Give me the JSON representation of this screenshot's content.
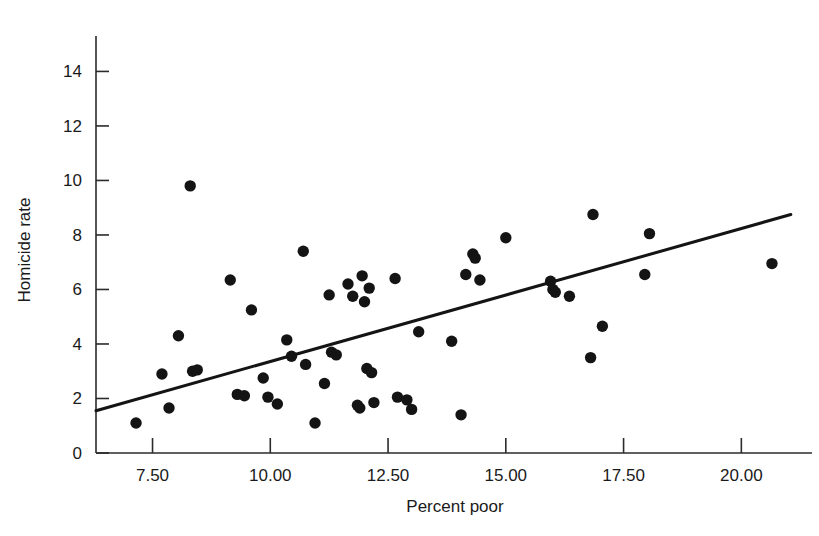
{
  "chart_data": {
    "type": "scatter",
    "title": "",
    "xlabel": "Percent poor",
    "ylabel": "Homicide rate",
    "xlim": [
      6.3,
      21.5
    ],
    "ylim": [
      0,
      15.3
    ],
    "xticks": [
      7.5,
      10.0,
      12.5,
      15.0,
      17.5,
      20.0
    ],
    "xtick_labels": [
      "7.50",
      "10.00",
      "12.50",
      "15.00",
      "17.50",
      "20.00"
    ],
    "yticks": [
      0,
      2,
      4,
      6,
      8,
      10,
      12,
      14
    ],
    "ytick_labels": [
      "0",
      "2",
      "4",
      "6",
      "8",
      "10",
      "12",
      "14"
    ],
    "grid": false,
    "legend": null,
    "marker": {
      "shape": "circle",
      "color": "#141414",
      "size": 9
    },
    "points": [
      {
        "x": 7.15,
        "y": 1.1
      },
      {
        "x": 7.7,
        "y": 2.9
      },
      {
        "x": 7.85,
        "y": 1.65
      },
      {
        "x": 8.05,
        "y": 4.3
      },
      {
        "x": 8.3,
        "y": 9.8
      },
      {
        "x": 8.35,
        "y": 3.0
      },
      {
        "x": 8.45,
        "y": 3.05
      },
      {
        "x": 9.15,
        "y": 6.35
      },
      {
        "x": 9.3,
        "y": 2.15
      },
      {
        "x": 9.45,
        "y": 2.1
      },
      {
        "x": 9.6,
        "y": 5.25
      },
      {
        "x": 9.85,
        "y": 2.75
      },
      {
        "x": 9.95,
        "y": 2.05
      },
      {
        "x": 10.15,
        "y": 1.8
      },
      {
        "x": 10.35,
        "y": 4.15
      },
      {
        "x": 10.45,
        "y": 3.55
      },
      {
        "x": 10.7,
        "y": 7.4
      },
      {
        "x": 10.75,
        "y": 3.25
      },
      {
        "x": 10.95,
        "y": 1.1
      },
      {
        "x": 11.15,
        "y": 2.55
      },
      {
        "x": 11.25,
        "y": 5.8
      },
      {
        "x": 11.3,
        "y": 3.7
      },
      {
        "x": 11.4,
        "y": 3.6
      },
      {
        "x": 11.65,
        "y": 6.2
      },
      {
        "x": 11.75,
        "y": 5.75
      },
      {
        "x": 11.85,
        "y": 1.75
      },
      {
        "x": 11.9,
        "y": 1.65
      },
      {
        "x": 11.95,
        "y": 6.5
      },
      {
        "x": 12.0,
        "y": 5.55
      },
      {
        "x": 12.05,
        "y": 3.1
      },
      {
        "x": 12.1,
        "y": 6.05
      },
      {
        "x": 12.15,
        "y": 2.95
      },
      {
        "x": 12.2,
        "y": 1.85
      },
      {
        "x": 12.65,
        "y": 6.4
      },
      {
        "x": 12.7,
        "y": 2.05
      },
      {
        "x": 12.9,
        "y": 1.95
      },
      {
        "x": 13.0,
        "y": 1.6
      },
      {
        "x": 13.15,
        "y": 4.45
      },
      {
        "x": 13.85,
        "y": 4.1
      },
      {
        "x": 14.05,
        "y": 1.4
      },
      {
        "x": 14.15,
        "y": 6.55
      },
      {
        "x": 14.3,
        "y": 7.3
      },
      {
        "x": 14.35,
        "y": 7.15
      },
      {
        "x": 14.45,
        "y": 6.35
      },
      {
        "x": 15.0,
        "y": 7.9
      },
      {
        "x": 15.95,
        "y": 6.3
      },
      {
        "x": 16.0,
        "y": 6.0
      },
      {
        "x": 16.05,
        "y": 5.9
      },
      {
        "x": 16.35,
        "y": 5.75
      },
      {
        "x": 16.8,
        "y": 3.5
      },
      {
        "x": 16.85,
        "y": 8.75
      },
      {
        "x": 17.05,
        "y": 4.65
      },
      {
        "x": 17.95,
        "y": 6.55
      },
      {
        "x": 18.05,
        "y": 8.05
      },
      {
        "x": 20.65,
        "y": 6.95
      }
    ],
    "fit_line": {
      "type": "linear-regression",
      "x_start": 6.3,
      "y_start": 1.55,
      "x_end": 21.05,
      "y_end": 8.75
    }
  },
  "figure": {
    "cropped_title_fragment": "",
    "background_color": "#ffffff",
    "axis_color": "#2b2b2b",
    "point_color": "#141414",
    "line_color": "#141414"
  }
}
